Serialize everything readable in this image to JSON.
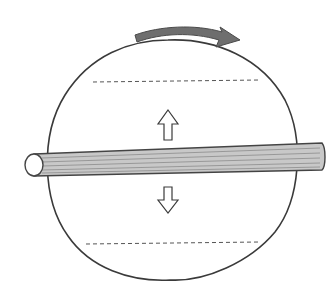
{
  "diagram": {
    "description": "Hand-drawn sketch of a sphere rotating about a horizontal rod axis",
    "elements": {
      "rotation_arrow": {
        "direction": "clockwise-right",
        "color": "#6e6e6e"
      },
      "sphere": {
        "outline_color": "#3a3a3a",
        "fill": "#ffffff"
      },
      "latitude_lines": [
        {
          "position": "upper",
          "style": "dashed"
        },
        {
          "position": "lower",
          "style": "dashed"
        }
      ],
      "axis_rod": {
        "fill": "#c8c8c8",
        "stroke": "#444444",
        "orientation": "horizontal"
      },
      "force_arrows": [
        {
          "direction": "up",
          "position": "above-rod"
        },
        {
          "direction": "down",
          "position": "below-rod"
        }
      ]
    },
    "colors": {
      "ink": "#3a3a3a",
      "rod_fill": "#c8c8c8",
      "arrow_fill": "#6e6e6e",
      "background": "#ffffff"
    }
  }
}
